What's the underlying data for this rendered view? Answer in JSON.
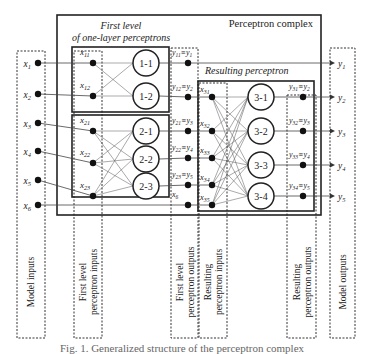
{
  "titles": {
    "perceptron_complex": "Perceptron complex",
    "first_level_line1": "First level",
    "first_level_line2": "of one-layer perceptrons",
    "resulting_perceptron": "Resulting perceptron"
  },
  "model_inputs": [
    "x1",
    "x2",
    "x3",
    "x4",
    "x5",
    "x6"
  ],
  "model_inputs_sub": [
    {
      "base": "x",
      "sub": "1"
    },
    {
      "base": "x",
      "sub": "2"
    },
    {
      "base": "x",
      "sub": "3"
    },
    {
      "base": "x",
      "sub": "4"
    },
    {
      "base": "x",
      "sub": "5"
    },
    {
      "base": "x",
      "sub": "6"
    }
  ],
  "first_level_inputs": [
    {
      "base": "x",
      "sub": "11"
    },
    {
      "base": "x",
      "sub": "12"
    },
    {
      "base": "x",
      "sub": "21"
    },
    {
      "base": "x",
      "sub": "22"
    },
    {
      "base": "x",
      "sub": "23"
    }
  ],
  "first_level_nodes": [
    "1-1",
    "1-2",
    "2-1",
    "2-2",
    "2-3"
  ],
  "first_level_outputs": [
    {
      "base": "y",
      "sub": "11",
      "eq": "≡y",
      "eqsub": "1"
    },
    {
      "base": "y",
      "sub": "12",
      "eq": "≡y",
      "eqsub": "2"
    },
    {
      "base": "y",
      "sub": "21",
      "eq": "≡y",
      "eqsub": "3"
    },
    {
      "base": "y",
      "sub": "22",
      "eq": "≡y",
      "eqsub": "4"
    },
    {
      "base": "y",
      "sub": "23",
      "eq": "≡y",
      "eqsub": "5"
    },
    {
      "base": "x",
      "sub": "6",
      "eq": "",
      "eqsub": ""
    }
  ],
  "resulting_inputs": [
    {
      "base": "x",
      "sub": "31"
    },
    {
      "base": "x",
      "sub": "32"
    },
    {
      "base": "x",
      "sub": "33"
    },
    {
      "base": "x",
      "sub": "34"
    },
    {
      "base": "x",
      "sub": "35"
    }
  ],
  "resulting_nodes": [
    "3-1",
    "3-2",
    "3-3",
    "3-4"
  ],
  "resulting_outputs": [
    {
      "base": "y",
      "sub": "31",
      "eq": "≡y",
      "eqsub": "2"
    },
    {
      "base": "y",
      "sub": "32",
      "eq": "≡y",
      "eqsub": "3"
    },
    {
      "base": "y",
      "sub": "33",
      "eq": "≡y",
      "eqsub": "4"
    },
    {
      "base": "y",
      "sub": "34",
      "eq": "≡y",
      "eqsub": "5"
    }
  ],
  "model_outputs": [
    {
      "base": "y",
      "sub": "1"
    },
    {
      "base": "y",
      "sub": "2"
    },
    {
      "base": "y",
      "sub": "3"
    },
    {
      "base": "y",
      "sub": "4"
    },
    {
      "base": "y",
      "sub": "5"
    }
  ],
  "column_labels": {
    "model_inputs": [
      "Model inputs"
    ],
    "first_level_inputs": [
      "First level",
      "perceptron inputs"
    ],
    "first_level_outputs": [
      "First level",
      "perceptron outputs"
    ],
    "resulting_inputs": [
      "Resulting",
      "perceptron inputs"
    ],
    "resulting_outputs": [
      "Resulting",
      "perceptron outputs"
    ],
    "model_outputs": [
      "Model outputs"
    ]
  },
  "caption": "Fig. 1. Generalized structure of the perceptron complex"
}
